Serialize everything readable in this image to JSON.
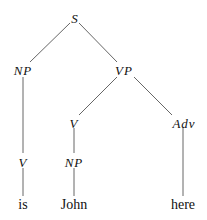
{
  "diagram": {
    "type": "parse-tree",
    "nodes": [
      {
        "id": "S",
        "label": "S",
        "kind": "category",
        "x": 75,
        "y": 19
      },
      {
        "id": "NP1",
        "label": "NP",
        "kind": "category",
        "x": 23,
        "y": 71
      },
      {
        "id": "VP",
        "label": "VP",
        "kind": "category",
        "x": 124,
        "y": 71
      },
      {
        "id": "V2",
        "label": "V",
        "kind": "category",
        "x": 74,
        "y": 124
      },
      {
        "id": "Adv",
        "label": "Adv",
        "kind": "category",
        "x": 184,
        "y": 124
      },
      {
        "id": "V1",
        "label": "V",
        "kind": "category",
        "x": 23,
        "y": 163
      },
      {
        "id": "NP2",
        "label": "NP",
        "kind": "category",
        "x": 74,
        "y": 163
      },
      {
        "id": "w_is",
        "label": "is",
        "kind": "word",
        "x": 23,
        "y": 205
      },
      {
        "id": "w_john",
        "label": "John",
        "kind": "word",
        "x": 74,
        "y": 205
      },
      {
        "id": "w_here",
        "label": "here",
        "kind": "word",
        "x": 183,
        "y": 205
      }
    ],
    "edges": [
      [
        "S",
        "NP1"
      ],
      [
        "S",
        "VP"
      ],
      [
        "NP1",
        "V1"
      ],
      [
        "V1",
        "w_is"
      ],
      [
        "VP",
        "V2"
      ],
      [
        "VP",
        "Adv"
      ],
      [
        "V2",
        "NP2"
      ],
      [
        "NP2",
        "w_john"
      ],
      [
        "Adv",
        "w_here"
      ]
    ]
  },
  "labels": {
    "S": "S",
    "NP1": "NP",
    "VP": "VP",
    "V2": "V",
    "Adv": "Adv",
    "V1": "V",
    "NP2": "NP",
    "w_is": "is",
    "w_john": "John",
    "w_here": "here"
  }
}
